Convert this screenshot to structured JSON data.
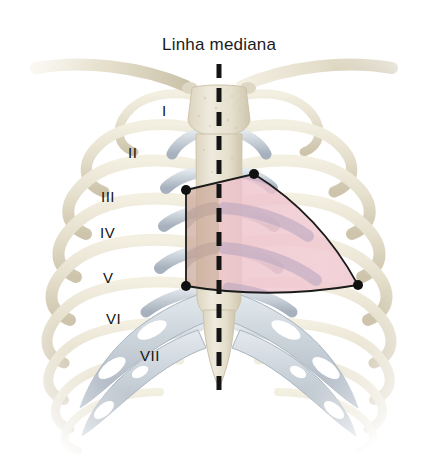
{
  "figure": {
    "title": "Linha mediana",
    "language": "pt-BR",
    "background_color": "#ffffff"
  },
  "midline": {
    "label": "Linha mediana",
    "style": "dashed",
    "color": "#141414",
    "x": 219,
    "y_top": 64,
    "y_bottom": 400,
    "dash_length": 14,
    "gap_length": 10,
    "width": 5
  },
  "rib_labels": [
    {
      "numeral": "I",
      "x": 162,
      "y": 110
    },
    {
      "numeral": "II",
      "x": 132,
      "y": 152
    },
    {
      "numeral": "III",
      "x": 107,
      "y": 196
    },
    {
      "numeral": "IV",
      "x": 104,
      "y": 232
    },
    {
      "numeral": "V",
      "x": 105,
      "y": 277
    },
    {
      "numeral": "VI",
      "x": 110,
      "y": 318
    },
    {
      "numeral": "VII",
      "x": 145,
      "y": 355
    }
  ],
  "region": {
    "name": "cardiac-projection-area",
    "outline_color": "#1a1a1a",
    "outline_width": 1.8,
    "vertices": [
      {
        "name": "superior-left",
        "x": 186,
        "y": 190
      },
      {
        "name": "superior-right",
        "x": 254,
        "y": 174
      },
      {
        "name": "inferior-right",
        "x": 358,
        "y": 285
      },
      {
        "name": "inferior-left",
        "x": 186,
        "y": 286
      }
    ],
    "vertex_marker_color": "#111111",
    "vertex_marker_radius": 5,
    "fill_left_color": "#c9a898",
    "fill_right_color": "#efc6cf"
  },
  "palette": {
    "bone": "#e6e0ce",
    "bone_shadow": "#cdc4ab",
    "bone_highlight": "#f4f0e3",
    "cartilage": "#c6ced6",
    "cartilage_shadow": "#a8b3bf",
    "cartilage_highlight": "#e1e7ec",
    "sternum": "#e9e3d2",
    "heart_pink": "#efc6cf",
    "heart_mauve": "#bfaec4",
    "shadow_brown": "#c9a898",
    "outline": "#1a1a1a",
    "text": "#141414"
  },
  "anatomy": {
    "clavicle_left": "clavicle-left",
    "clavicle_right": "clavicle-right",
    "manubrium": "manubrium",
    "sternum_body": "sternum-body",
    "xiphoid": "xiphoid-process",
    "rib_count_visible": 10,
    "costal_cartilage": "costal-cartilage",
    "costal_margin": "costal-margin"
  }
}
